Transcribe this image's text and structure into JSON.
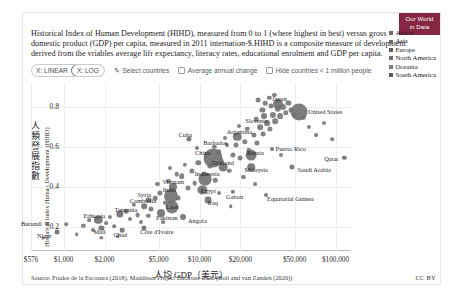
{
  "logo": {
    "line1": "Our World",
    "line2": "in Data",
    "color": "#852743"
  },
  "subtitle": "Historical Index of Human Development (HIHD), measured from 0 to 1 (where highest in best) versus gross domestic product (GDP) per capita, measured in 2011 internation-$.HIHD is a composite measure of development derived from the vriables average lifr expectancy, literacy rates, educational enrolment and GDP per capita.",
  "toolbar": {
    "seg_linear": "X: LINEAR",
    "seg_log": "X: LOG",
    "seg_selected": "X: LOG",
    "select_countries": "Select countries",
    "pencil_icon": "✎",
    "avg_annual_change": "Average annual change",
    "hide_small_countries": "Hide countries < 1 million people"
  },
  "footer": {
    "source": "Source: Prados de la Escosura (2018), Maddison Project Database 2020 (Bolt and van Zanden (2020))",
    "license": "CC BY"
  },
  "chart_data": {
    "type": "scatter",
    "title": "",
    "xlabel": "人均 GDP（美元）",
    "ylabel": "人類發展指數",
    "ylabel_en": "Historical Index Human Development (HIHD)",
    "xscale": "log",
    "xlim": [
      576,
      130000
    ],
    "ylim": [
      0.08,
      0.92
    ],
    "grid": true,
    "legend_position": "right",
    "xticks": [
      "$576",
      "$1,000",
      "$2,000",
      "$5,000",
      "$10,000",
      "$20,000",
      "$50,000",
      "$100,000"
    ],
    "xtick_values": [
      576,
      1000,
      2000,
      5000,
      10000,
      20000,
      50000,
      100000
    ],
    "yticks": [
      "0.2",
      "0.4",
      "0.6",
      "0.8"
    ],
    "ytick_values": [
      0.2,
      0.4,
      0.6,
      0.8
    ],
    "legend": [
      {
        "name": "Africa",
        "color": "#7a6a63"
      },
      {
        "name": "Asia",
        "color": "#6b6b6b"
      },
      {
        "name": "Europe",
        "color": "#5f5f5f"
      },
      {
        "name": "North America",
        "color": "#6f6f6f"
      },
      {
        "name": "Oceania",
        "color": "#7d7d7d"
      },
      {
        "name": "South America",
        "color": "#585858"
      }
    ],
    "points": [
      {
        "name": "Burundi",
        "x": 760,
        "y": 0.215,
        "r": 2.0,
        "c": "#6f6f6f",
        "lx": -16,
        "ly": -1
      },
      {
        "name": "Niger",
        "x": 900,
        "y": 0.175,
        "r": 2.4,
        "c": "#6f6f6f",
        "lx": -13,
        "ly": 3
      },
      {
        "name": "Mali",
        "x": 1900,
        "y": 0.195,
        "r": 2.6,
        "c": "#6f6f6f",
        "lx": -2,
        "ly": 3
      },
      {
        "name": "Ethiopia",
        "x": 1800,
        "y": 0.235,
        "r": 4.2,
        "c": "#6f6f6f",
        "lx": -4,
        "ly": -5
      },
      {
        "name": "Chad",
        "x": 2700,
        "y": 0.185,
        "r": 2.3,
        "c": "#6f6f6f",
        "lx": -2,
        "ly": 4
      },
      {
        "name": "Côte d'Ivoire",
        "x": 3900,
        "y": 0.195,
        "r": 2.6,
        "c": "#6f6f6f",
        "lx": 13,
        "ly": 3
      },
      {
        "name": "Tanzania",
        "x": 2600,
        "y": 0.265,
        "r": 3.6,
        "c": "#6f6f6f",
        "lx": 6,
        "ly": -5
      },
      {
        "name": "Syria",
        "x": 4200,
        "y": 0.335,
        "r": 2.6,
        "c": "#6f6f6f",
        "lx": -4,
        "ly": -6
      },
      {
        "name": "Cambodia",
        "x": 3900,
        "y": 0.305,
        "r": 2.8,
        "c": "#6f6f6f",
        "lx": -1,
        "ly": -6
      },
      {
        "name": "Vietnam",
        "x": 6400,
        "y": 0.4,
        "r": 4.0,
        "c": "#6f6f6f",
        "lx": 0,
        "ly": -6
      },
      {
        "name": "India",
        "x": 6200,
        "y": 0.355,
        "r": 7.0,
        "c": "#6f6f6f",
        "lx": -2,
        "ly": -7
      },
      {
        "name": "Laos",
        "x": 6300,
        "y": 0.3,
        "r": 6.5,
        "c": "#6f6f6f",
        "lx": 0,
        "ly": -1
      },
      {
        "name": "Pakistan",
        "x": 5200,
        "y": 0.27,
        "r": 4.0,
        "c": "#6f6f6f",
        "lx": 6,
        "ly": 4
      },
      {
        "name": "Indonesia",
        "x": 11000,
        "y": 0.44,
        "r": 6.4,
        "c": "#6f6f6f",
        "lx": 2,
        "ly": -6
      },
      {
        "name": "Egypt",
        "x": 10500,
        "y": 0.385,
        "r": 4.6,
        "c": "#6f6f6f",
        "lx": 6,
        "ly": 0
      },
      {
        "name": "Iraq",
        "x": 11500,
        "y": 0.335,
        "r": 3.4,
        "c": "#6f6f6f",
        "lx": 5,
        "ly": 2
      },
      {
        "name": "Angola",
        "x": 7600,
        "y": 0.25,
        "r": 3.0,
        "c": "#6f6f6f",
        "lx": 14,
        "ly": 3
      },
      {
        "name": "Gabon",
        "x": 17500,
        "y": 0.375,
        "r": 2.2,
        "c": "#6f6f6f",
        "lx": 2,
        "ly": 4
      },
      {
        "name": "Equatorial Guinea",
        "x": 31000,
        "y": 0.36,
        "r": 2.0,
        "c": "#6f6f6f",
        "lx": 24,
        "ly": 3
      },
      {
        "name": "China",
        "x": 12500,
        "y": 0.545,
        "r": 9.5,
        "c": "#6f6f6f",
        "lx": -10,
        "ly": -6
      },
      {
        "name": "Thailand",
        "x": 15000,
        "y": 0.5,
        "r": 4.4,
        "c": "#6f6f6f",
        "lx": -1,
        "ly": -5
      },
      {
        "name": "Malaysia",
        "x": 24000,
        "y": 0.5,
        "r": 3.8,
        "c": "#6f6f6f",
        "lx": 5,
        "ly": 2
      },
      {
        "name": "Russia",
        "x": 24000,
        "y": 0.56,
        "r": 5.4,
        "c": "#6f6f6f",
        "lx": 4,
        "ly": -3
      },
      {
        "name": "Cuba",
        "x": 8400,
        "y": 0.64,
        "r": 2.6,
        "c": "#6f6f6f",
        "lx": -4,
        "ly": -5
      },
      {
        "name": "Barbados",
        "x": 16000,
        "y": 0.61,
        "r": 2.0,
        "c": "#6f6f6f",
        "lx": -12,
        "ly": -3
      },
      {
        "name": "Argentina",
        "x": 19000,
        "y": 0.65,
        "r": 4.2,
        "c": "#6f6f6f",
        "lx": 2,
        "ly": -6
      },
      {
        "name": "Puerto Rico",
        "x": 34000,
        "y": 0.59,
        "r": 2.0,
        "c": "#6f6f6f",
        "lx": 19,
        "ly": -1
      },
      {
        "name": "Saudi Arabia",
        "x": 48000,
        "y": 0.5,
        "r": 2.6,
        "c": "#6f6f6f",
        "lx": 22,
        "ly": 2
      },
      {
        "name": "Slovenia",
        "x": 30000,
        "y": 0.755,
        "r": 3.0,
        "c": "#6f6f6f",
        "lx": -8,
        "ly": 4
      },
      {
        "name": "Japan",
        "x": 38000,
        "y": 0.815,
        "r": 5.0,
        "c": "#6f6f6f",
        "lx": 1,
        "ly": -6
      },
      {
        "name": "United States",
        "x": 54000,
        "y": 0.775,
        "r": 8.5,
        "c": "#6f6f6f",
        "lx": 26,
        "ly": -1
      },
      {
        "name": "Qatar",
        "x": 116000,
        "y": 0.545,
        "r": 2.2,
        "c": "#6f6f6f",
        "lx": -13,
        "ly": 0
      }
    ],
    "unlabeled_points": [
      {
        "x": 700,
        "y": 0.145,
        "r": 1.6
      },
      {
        "x": 1050,
        "y": 0.215,
        "r": 1.8
      },
      {
        "x": 1250,
        "y": 0.165,
        "r": 1.8
      },
      {
        "x": 1400,
        "y": 0.205,
        "r": 2.2
      },
      {
        "x": 1550,
        "y": 0.235,
        "r": 1.9
      },
      {
        "x": 1650,
        "y": 0.185,
        "r": 2.0
      },
      {
        "x": 2050,
        "y": 0.22,
        "r": 1.9
      },
      {
        "x": 2200,
        "y": 0.25,
        "r": 2.1
      },
      {
        "x": 2350,
        "y": 0.205,
        "r": 1.8
      },
      {
        "x": 2900,
        "y": 0.28,
        "r": 2.3
      },
      {
        "x": 3100,
        "y": 0.24,
        "r": 2.0
      },
      {
        "x": 3300,
        "y": 0.31,
        "r": 2.2
      },
      {
        "x": 3500,
        "y": 0.26,
        "r": 2.4
      },
      {
        "x": 4400,
        "y": 0.29,
        "r": 2.5
      },
      {
        "x": 4700,
        "y": 0.345,
        "r": 2.3
      },
      {
        "x": 5100,
        "y": 0.37,
        "r": 2.6
      },
      {
        "x": 5600,
        "y": 0.32,
        "r": 2.2
      },
      {
        "x": 5900,
        "y": 0.43,
        "r": 2.1
      },
      {
        "x": 7000,
        "y": 0.345,
        "r": 2.4
      },
      {
        "x": 7400,
        "y": 0.455,
        "r": 2.8
      },
      {
        "x": 8200,
        "y": 0.395,
        "r": 2.5
      },
      {
        "x": 8800,
        "y": 0.48,
        "r": 2.6
      },
      {
        "x": 9200,
        "y": 0.42,
        "r": 2.3
      },
      {
        "x": 9800,
        "y": 0.52,
        "r": 2.7
      },
      {
        "x": 10800,
        "y": 0.465,
        "r": 2.4
      },
      {
        "x": 12000,
        "y": 0.505,
        "r": 2.6
      },
      {
        "x": 13000,
        "y": 0.435,
        "r": 2.3
      },
      {
        "x": 13800,
        "y": 0.575,
        "r": 2.8
      },
      {
        "x": 14500,
        "y": 0.53,
        "r": 2.4
      },
      {
        "x": 16500,
        "y": 0.48,
        "r": 2.2
      },
      {
        "x": 17500,
        "y": 0.56,
        "r": 2.6
      },
      {
        "x": 18500,
        "y": 0.61,
        "r": 2.5
      },
      {
        "x": 20000,
        "y": 0.545,
        "r": 2.4
      },
      {
        "x": 21500,
        "y": 0.625,
        "r": 2.7
      },
      {
        "x": 23000,
        "y": 0.585,
        "r": 2.3
      },
      {
        "x": 25000,
        "y": 0.66,
        "r": 2.6
      },
      {
        "x": 26500,
        "y": 0.62,
        "r": 2.5
      },
      {
        "x": 28000,
        "y": 0.7,
        "r": 2.8
      },
      {
        "x": 29500,
        "y": 0.665,
        "r": 2.4
      },
      {
        "x": 31500,
        "y": 0.72,
        "r": 2.9
      },
      {
        "x": 33000,
        "y": 0.69,
        "r": 2.6
      },
      {
        "x": 34500,
        "y": 0.76,
        "r": 3.1
      },
      {
        "x": 36000,
        "y": 0.73,
        "r": 2.8
      },
      {
        "x": 37500,
        "y": 0.79,
        "r": 3.2
      },
      {
        "x": 39000,
        "y": 0.755,
        "r": 2.9
      },
      {
        "x": 41000,
        "y": 0.8,
        "r": 3.0
      },
      {
        "x": 43000,
        "y": 0.77,
        "r": 2.7
      },
      {
        "x": 45000,
        "y": 0.82,
        "r": 2.6
      },
      {
        "x": 47000,
        "y": 0.785,
        "r": 2.5
      },
      {
        "x": 50000,
        "y": 0.76,
        "r": 2.4
      },
      {
        "x": 58000,
        "y": 0.745,
        "r": 2.2
      },
      {
        "x": 64000,
        "y": 0.7,
        "r": 2.0
      },
      {
        "x": 72000,
        "y": 0.66,
        "r": 1.9
      },
      {
        "x": 82000,
        "y": 0.72,
        "r": 2.0
      },
      {
        "x": 95000,
        "y": 0.64,
        "r": 1.8
      },
      {
        "x": 27000,
        "y": 0.835,
        "r": 2.4
      },
      {
        "x": 32500,
        "y": 0.845,
        "r": 2.2
      },
      {
        "x": 35500,
        "y": 0.86,
        "r": 2.1
      },
      {
        "x": 30500,
        "y": 0.82,
        "r": 2.3
      },
      {
        "x": 33500,
        "y": 0.805,
        "r": 2.5
      },
      {
        "x": 29000,
        "y": 0.785,
        "r": 2.6
      },
      {
        "x": 26000,
        "y": 0.74,
        "r": 2.3
      },
      {
        "x": 22500,
        "y": 0.69,
        "r": 2.2
      },
      {
        "x": 19500,
        "y": 0.705,
        "r": 2.1
      },
      {
        "x": 15500,
        "y": 0.645,
        "r": 2.0
      },
      {
        "x": 12800,
        "y": 0.6,
        "r": 2.2
      },
      {
        "x": 11200,
        "y": 0.555,
        "r": 2.1
      },
      {
        "x": 9500,
        "y": 0.595,
        "r": 2.0
      },
      {
        "x": 7800,
        "y": 0.51,
        "r": 2.2
      },
      {
        "x": 6800,
        "y": 0.465,
        "r": 2.3
      },
      {
        "x": 6100,
        "y": 0.495,
        "r": 2.0
      },
      {
        "x": 4900,
        "y": 0.415,
        "r": 2.1
      },
      {
        "x": 4200,
        "y": 0.255,
        "r": 2.2
      },
      {
        "x": 3700,
        "y": 0.225,
        "r": 2.0
      },
      {
        "x": 2500,
        "y": 0.155,
        "r": 1.8
      },
      {
        "x": 1900,
        "y": 0.145,
        "r": 1.7
      },
      {
        "x": 5400,
        "y": 0.225,
        "r": 1.9
      },
      {
        "x": 14000,
        "y": 0.37,
        "r": 2.0
      },
      {
        "x": 21000,
        "y": 0.45,
        "r": 2.1
      },
      {
        "x": 40000,
        "y": 0.56,
        "r": 2.0
      },
      {
        "x": 25500,
        "y": 0.415,
        "r": 1.9
      },
      {
        "x": 17000,
        "y": 0.305,
        "r": 1.8
      }
    ]
  }
}
